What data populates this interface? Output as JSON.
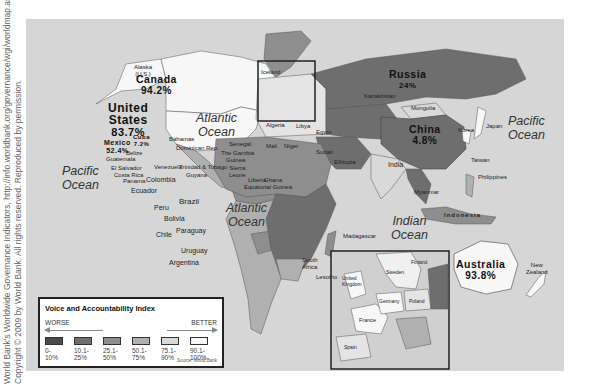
{
  "credit": {
    "line1": "World Bank's Worldwide Governance Indicators, http://info.worldbank.org/governance/wgi/worldmap.asp.",
    "line2": "Copyright © 2009 by World Bank. All rights reserved. Reproduced by permission."
  },
  "colors": {
    "ocean": "#d6d6d6",
    "band_0_10": "#4a4a4a",
    "band_10_25": "#6e6e6e",
    "band_25_50": "#8e8e8e",
    "band_50_75": "#b0b0b0",
    "band_75_90": "#d9d9d9",
    "band_90_100": "#f7f7f7"
  },
  "oceans": {
    "atlantic_north": "Atlantic\nOcean",
    "atlantic_south": "Atlantic\nOcean",
    "pacific_east": "Pacific\nOcean",
    "pacific_west": "Pacific\nOcean",
    "indian": "Indian\nOcean"
  },
  "highlighted": {
    "canada": {
      "name": "Canada",
      "value": "94.2%"
    },
    "us": {
      "name": "United\nStates",
      "value": "83.7%"
    },
    "mexico": {
      "name": "Mexico",
      "value": "52.4%"
    },
    "cuba": {
      "name": "Cuba",
      "value": "7.2%"
    },
    "russia": {
      "name": "Russia",
      "value": "24%"
    },
    "china": {
      "name": "China",
      "value": "4.8%"
    },
    "australia": {
      "name": "Australia",
      "value": "93.8%"
    }
  },
  "labels": {
    "alaska": "Alaska\n(U.S.)",
    "greenland": "Greenland",
    "iceland": "Iceland",
    "bahamas": "Bahamas",
    "dominican": "Dominican Rep.",
    "guatemala": "Guatemala",
    "belize": "Belize",
    "el_salvador": "El Salvador",
    "costa_rica": "Costa Rica",
    "panama": "Panama",
    "venezuela": "Venezuela",
    "colombia": "Colombia",
    "trinidad": "Trinidad & Tobago",
    "guyana": "Guyana",
    "ecuador": "Ecuador",
    "peru": "Peru",
    "brazil": "Brazil",
    "bolivia": "Bolivia",
    "paraguay": "Paraguay",
    "chile": "Chile",
    "uruguay": "Uruguay",
    "argentina": "Argentina",
    "morocco": "Morocco",
    "algeria": "Algeria",
    "libya": "Libya",
    "egypt": "Egypt",
    "mali": "Mali",
    "niger": "Niger",
    "sudan": "Sudan",
    "ethiopia": "Ethiopia",
    "senegal": "Senegal",
    "gambia": "The Gambia",
    "guinea": "Guinea",
    "sierra_leone": "Sierra\nLeone",
    "liberia": "Liberia",
    "ghana": "Ghana",
    "eq_guinea": "Equatorial Guinea",
    "madagascar": "Madagascar",
    "south_africa": "South\nAfrica",
    "lesotho": "Lesotho",
    "kazakhstan": "Kazakhstan",
    "mongolia": "Mongolia",
    "india": "India",
    "japan": "Japan",
    "korea": "Korea",
    "taiwan": "Taiwan",
    "philippines": "Philippines",
    "myanmar": "Myanmar",
    "indonesia": "Indonesia",
    "new_zealand": "New\nZealand",
    "uk": "United\nKingdom",
    "france": "France",
    "germany": "Germany",
    "poland": "Poland",
    "spain": "Spain",
    "sweden": "Sweden",
    "finland": "Finland"
  },
  "legend": {
    "title": "Voice and Accountability Index",
    "worse": "WORSE",
    "better": "BETTER",
    "bands": [
      {
        "label": "0-\n10%"
      },
      {
        "label": "10.1-\n25%"
      },
      {
        "label": "25.1-\n50%"
      },
      {
        "label": "50.1-\n75%"
      },
      {
        "label": "75.1-\n90%"
      },
      {
        "label": "90.1-\n100%"
      }
    ],
    "source": "Source: World Bank"
  }
}
